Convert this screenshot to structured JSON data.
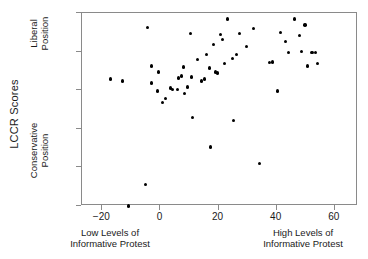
{
  "chart_data": {
    "type": "scatter",
    "title": "",
    "xlabel": "Informative Protest",
    "ylabel": "LCCR Scores",
    "xlabel_left": "Low Levels of\nInformative Protest",
    "xlabel_right": "High Levels of\nInformative Protest",
    "ylabel_top": "Liberal\nPosition",
    "ylabel_bottom": "Conservative\nPosition",
    "xlim": [
      -27,
      68
    ],
    "ylim": [
      0,
      100
    ],
    "xticks": [
      -20,
      0,
      20,
      40,
      60
    ],
    "yticks": [
      0,
      20,
      40,
      60,
      80,
      100
    ],
    "grid": false,
    "legend": null,
    "marker_color": "#000000",
    "frame_color": "#8a8a8a",
    "points": [
      {
        "x": -17.2,
        "y": 65.8
      },
      {
        "x": -13.1,
        "y": 64.7
      },
      {
        "x": -11.0,
        "y": 0.0
      },
      {
        "x": -5.2,
        "y": 11.0
      },
      {
        "x": -4.5,
        "y": 92.6
      },
      {
        "x": -3.1,
        "y": 72.6
      },
      {
        "x": -3.1,
        "y": 63.7
      },
      {
        "x": -1.0,
        "y": 59.5
      },
      {
        "x": -0.7,
        "y": 69.5
      },
      {
        "x": 0.7,
        "y": 53.7
      },
      {
        "x": 1.7,
        "y": 55.8
      },
      {
        "x": 3.4,
        "y": 61.1
      },
      {
        "x": 4.1,
        "y": 60.5
      },
      {
        "x": 5.9,
        "y": 60.5
      },
      {
        "x": 6.2,
        "y": 66.3
      },
      {
        "x": 7.2,
        "y": 67.4
      },
      {
        "x": 7.9,
        "y": 72.1
      },
      {
        "x": 8.3,
        "y": 58.4
      },
      {
        "x": 9.3,
        "y": 61.6
      },
      {
        "x": 10.3,
        "y": 89.5
      },
      {
        "x": 10.7,
        "y": 66.8
      },
      {
        "x": 11.0,
        "y": 45.8
      },
      {
        "x": 12.8,
        "y": 75.8
      },
      {
        "x": 14.1,
        "y": 64.7
      },
      {
        "x": 15.2,
        "y": 65.8
      },
      {
        "x": 15.9,
        "y": 78.4
      },
      {
        "x": 16.9,
        "y": 71.6
      },
      {
        "x": 17.2,
        "y": 30.5
      },
      {
        "x": 18.3,
        "y": 83.7
      },
      {
        "x": 19.0,
        "y": 69.5
      },
      {
        "x": 19.7,
        "y": 68.9
      },
      {
        "x": 20.7,
        "y": 88.9
      },
      {
        "x": 21.4,
        "y": 86.3
      },
      {
        "x": 22.1,
        "y": 73.7
      },
      {
        "x": 23.1,
        "y": 96.8
      },
      {
        "x": 24.8,
        "y": 76.3
      },
      {
        "x": 25.2,
        "y": 44.2
      },
      {
        "x": 26.2,
        "y": 78.4
      },
      {
        "x": 27.2,
        "y": 89.5
      },
      {
        "x": 29.7,
        "y": 82.6
      },
      {
        "x": 32.1,
        "y": 92.1
      },
      {
        "x": 34.1,
        "y": 22.1
      },
      {
        "x": 37.6,
        "y": 74.2
      },
      {
        "x": 38.6,
        "y": 74.7
      },
      {
        "x": 40.3,
        "y": 59.5
      },
      {
        "x": 41.4,
        "y": 90.0
      },
      {
        "x": 43.1,
        "y": 85.3
      },
      {
        "x": 44.1,
        "y": 79.5
      },
      {
        "x": 46.2,
        "y": 96.8
      },
      {
        "x": 47.9,
        "y": 88.4
      },
      {
        "x": 48.6,
        "y": 80.0
      },
      {
        "x": 49.7,
        "y": 93.7
      },
      {
        "x": 50.7,
        "y": 72.6
      },
      {
        "x": 52.1,
        "y": 79.5
      },
      {
        "x": 53.4,
        "y": 79.5
      },
      {
        "x": 54.1,
        "y": 73.7
      }
    ]
  }
}
